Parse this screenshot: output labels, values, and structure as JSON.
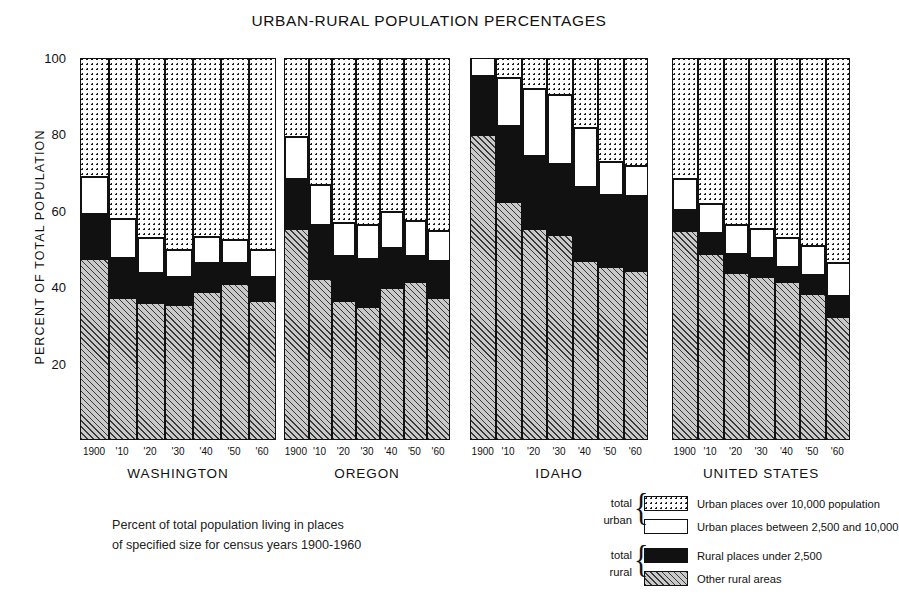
{
  "chart_data": {
    "type": "bar",
    "subtype": "stacked-bar-small-multiples",
    "title": "URBAN-RURAL POPULATION PERCENTAGES",
    "ylabel": "PERCENT OF TOTAL POPULATION",
    "xlabel": "",
    "ylim": [
      0,
      100
    ],
    "ytick_labels": [
      "100",
      "80",
      "60",
      "40",
      "20"
    ],
    "ytick_values": [
      100,
      80,
      60,
      40,
      20
    ],
    "yminor_values": [
      90,
      70,
      50,
      30,
      10
    ],
    "grid": false,
    "legend_position": "bottom-right",
    "categories": [
      "1900",
      "'10",
      "'20",
      "'30",
      "'40",
      "'50",
      "'60"
    ],
    "stack_order_bottom_to_top": [
      "Other rural areas",
      "Rural places under 2,500",
      "Urban places between 2,500 and 10,000",
      "Urban places over 10,000 population"
    ],
    "panels": [
      {
        "name": "WASHINGTON",
        "series": [
          {
            "name": "Other rural areas",
            "values": [
              47.0,
              37.0,
              35.5,
              35.0,
              38.5,
              40.5,
              36.0
            ]
          },
          {
            "name": "Rural places under 2,500",
            "values": [
              12.0,
              10.5,
              8.0,
              7.5,
              7.5,
              5.5,
              6.5
            ]
          },
          {
            "name": "Urban places between 2,500 and 10,000",
            "values": [
              9.5,
              10.0,
              9.0,
              7.0,
              7.0,
              6.0,
              7.0
            ]
          },
          {
            "name": "Urban places over 10,000 population",
            "values": [
              31.5,
              42.5,
              47.5,
              50.5,
              47.0,
              48.0,
              50.5
            ]
          }
        ]
      },
      {
        "name": "OREGON",
        "series": [
          {
            "name": "Other rural areas",
            "values": [
              55.0,
              42.0,
              36.0,
              34.5,
              39.5,
              41.0,
              37.0
            ]
          },
          {
            "name": "Rural places under 2,500",
            "values": [
              13.0,
              14.0,
              12.0,
              12.5,
              10.5,
              7.0,
              9.5
            ]
          },
          {
            "name": "Urban places between 2,500 and 10,000",
            "values": [
              11.0,
              10.5,
              8.5,
              9.0,
              9.5,
              9.0,
              8.0
            ]
          },
          {
            "name": "Urban places over 10,000 population",
            "values": [
              21.0,
              33.5,
              43.5,
              44.0,
              40.5,
              43.0,
              45.5
            ]
          }
        ]
      },
      {
        "name": "IDAHO",
        "series": [
          {
            "name": "Other rural areas",
            "values": [
              79.5,
              62.0,
              55.0,
              53.5,
              46.5,
              45.0,
              44.0
            ]
          },
          {
            "name": "Rural places under 2,500",
            "values": [
              15.5,
              20.0,
              19.0,
              18.5,
              19.5,
              19.0,
              19.5
            ]
          },
          {
            "name": "Urban places between 2,500 and 10,000",
            "values": [
              5.0,
              12.5,
              17.5,
              18.0,
              15.5,
              8.5,
              8.0
            ]
          },
          {
            "name": "Urban places over 10,000 population",
            "values": [
              0.0,
              5.5,
              8.5,
              10.0,
              18.5,
              27.5,
              28.5
            ]
          }
        ]
      },
      {
        "name": "UNITED STATES",
        "series": [
          {
            "name": "Other rural areas",
            "values": [
              54.5,
              48.5,
              43.5,
              42.5,
              41.0,
              38.0,
              32.0
            ]
          },
          {
            "name": "Rural places under 2,500",
            "values": [
              5.5,
              5.5,
              5.0,
              5.0,
              4.0,
              5.0,
              5.5
            ]
          },
          {
            "name": "Urban places between 2,500 and 10,000",
            "values": [
              8.0,
              7.5,
              7.5,
              7.5,
              7.5,
              7.5,
              8.5
            ]
          },
          {
            "name": "Urban places over 10,000 population",
            "values": [
              32.0,
              38.5,
              44.0,
              45.0,
              47.5,
              49.5,
              54.0
            ]
          }
        ]
      }
    ],
    "legend": [
      {
        "swatch": "dotted",
        "label": "Urban places over 10,000 population",
        "group": "total urban"
      },
      {
        "swatch": "white",
        "label": "Urban places between 2,500 and 10,000",
        "group": "total urban"
      },
      {
        "swatch": "black",
        "label": "Rural places under 2,500",
        "group": "total rural"
      },
      {
        "swatch": "hatch",
        "label": "Other rural areas",
        "group": "total rural"
      }
    ],
    "legend_groups": [
      {
        "line1": "total",
        "line2": "urban"
      },
      {
        "line1": "total",
        "line2": "rural"
      }
    ],
    "caption_lines": [
      "Percent of total population living in places",
      "of specified size for census years 1900-1960"
    ],
    "colors": {
      "ink": "#111111",
      "hatch_fill": "#c9c9c9",
      "black_fill": "#111111",
      "white_fill": "#ffffff",
      "background": "#ffffff"
    }
  }
}
